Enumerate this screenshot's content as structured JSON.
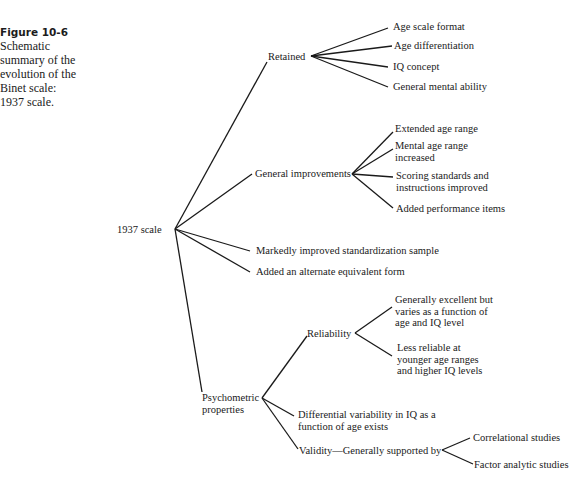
{
  "caption": {
    "figure_label": "Figure 10-6",
    "text": "Schematic summary of the evolution of the Binet scale: 1937 scale."
  },
  "tree": {
    "root": "1937 scale",
    "retained": {
      "label": "Retained",
      "children": [
        "Age scale format",
        "Age differentiation",
        "IQ concept",
        "General mental ability"
      ]
    },
    "general_improvements": {
      "label": "General improvements",
      "children": [
        "Extended age range",
        "Mental age range increased",
        "Scoring standards and instructions improved",
        "Added performance items"
      ]
    },
    "standardization": "Markedly improved standardization sample",
    "alternate_form": "Added an alternate equivalent form",
    "psychometric": {
      "label": "Psychometric properties",
      "reliability": {
        "label": "Reliability",
        "children": [
          "Generally excellent but varies as a function of age and IQ level",
          "Less reliable at younger age ranges and higher IQ levels"
        ]
      },
      "differential": "Differential variability in IQ as a function of age exists",
      "validity": {
        "label": "Validity—Generally supported by",
        "children": [
          "Correlational studies",
          "Factor analytic studies"
        ]
      }
    }
  }
}
